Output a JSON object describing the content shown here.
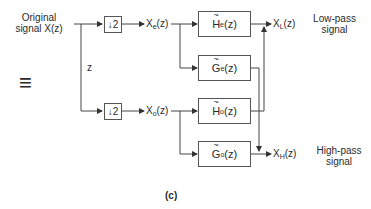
{
  "diagram": {
    "input_label_line1": "Original",
    "input_label_line2": "signal X(z)",
    "delay_label": "z",
    "downsampler_top": "↓2",
    "downsampler_bottom": "↓2",
    "even_signal": {
      "base": "X",
      "sub": "e",
      "tail": "(z)"
    },
    "odd_signal": {
      "base": "X",
      "sub": "o",
      "tail": "(z)"
    },
    "filters": {
      "He": {
        "base": "H",
        "sub": "e",
        "tail": "(z)"
      },
      "Ge": {
        "base": "G",
        "sub": "e",
        "tail": "(z)"
      },
      "Ho": {
        "base": "H",
        "sub": "o",
        "tail": "(z)"
      },
      "Go": {
        "base": "G",
        "sub": "o",
        "tail": "(z)"
      }
    },
    "output_low": {
      "base": "X",
      "sub": "L",
      "tail": "(z)"
    },
    "output_high": {
      "base": "X",
      "sub": "H",
      "tail": "(z)"
    },
    "low_pass_line1": "Low-pass",
    "low_pass_line2": "signal",
    "high_pass_line1": "High-pass",
    "high_pass_line2": "signal",
    "equivalence_symbol": "≡",
    "caption": "(c)"
  }
}
